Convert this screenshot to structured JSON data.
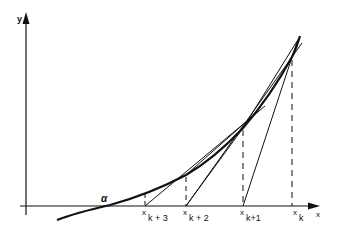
{
  "diagram": {
    "axes": {
      "x_label": "x",
      "y_label": "y"
    },
    "root_label": "α",
    "points": [
      {
        "name": "x_k",
        "base": "x",
        "sub": "k"
      },
      {
        "name": "x_k+1",
        "base": "x",
        "sub": "k+1"
      },
      {
        "name": "x_k+2",
        "base": "x",
        "sub": "k + 2"
      },
      {
        "name": "x_k+3",
        "base": "x",
        "sub": "k + 3"
      }
    ],
    "colors": {
      "line": "#111111",
      "background": "#ffffff"
    }
  }
}
